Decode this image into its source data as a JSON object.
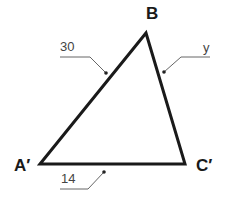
{
  "diagram": {
    "type": "triangle",
    "vertices": [
      {
        "id": "A",
        "label": "A′",
        "x": 40,
        "y": 164
      },
      {
        "id": "B",
        "label": "B",
        "x": 146,
        "y": 33
      },
      {
        "id": "C",
        "label": "C′",
        "x": 185,
        "y": 164
      }
    ],
    "sides": [
      {
        "from": "A",
        "to": "B",
        "label": "30"
      },
      {
        "from": "B",
        "to": "C",
        "label": "y"
      },
      {
        "from": "A",
        "to": "C",
        "label": "14"
      }
    ],
    "colors": {
      "stroke": "#1a1a1a",
      "leader": "#555555",
      "background": "#ffffff"
    }
  }
}
